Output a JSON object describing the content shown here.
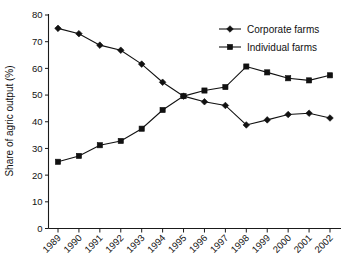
{
  "chart_data": {
    "type": "line",
    "title": "",
    "subtitle": "",
    "xlabel": "",
    "ylabel": "Share of agric output (%)",
    "categories": [
      "1989",
      "1990",
      "1991",
      "1992",
      "1993",
      "1994",
      "1995",
      "1996",
      "1997",
      "1998",
      "1999",
      "2000",
      "2001",
      "2002"
    ],
    "x": [
      1989,
      1990,
      1991,
      1992,
      1993,
      1994,
      1995,
      1996,
      1997,
      1998,
      1999,
      2000,
      2001,
      2002
    ],
    "series": [
      {
        "name": "Corporate farms",
        "marker": "diamond",
        "color": "#111111",
        "values": [
          75.0,
          73.0,
          68.7,
          66.8,
          61.6,
          54.8,
          49.6,
          47.5,
          46.1,
          38.8,
          40.7,
          42.7,
          43.2,
          41.4
        ]
      },
      {
        "name": "Individual farms",
        "marker": "square",
        "color": "#111111",
        "values": [
          25.0,
          27.2,
          31.2,
          32.8,
          37.4,
          44.4,
          49.6,
          51.7,
          53.0,
          60.7,
          58.5,
          56.3,
          55.5,
          57.4
        ]
      }
    ],
    "ylim": [
      0,
      80
    ],
    "yticks": [
      0,
      10,
      20,
      30,
      40,
      50,
      60,
      70,
      80
    ],
    "ytick_labels": [
      "0",
      "10",
      "20",
      "30",
      "40",
      "50",
      "60",
      "70",
      "80"
    ],
    "grid": false,
    "legend_position": "top-right",
    "legend_entries": [
      "Corporate farms",
      "Individual farms"
    ],
    "xtick_rotation_deg": 45
  }
}
